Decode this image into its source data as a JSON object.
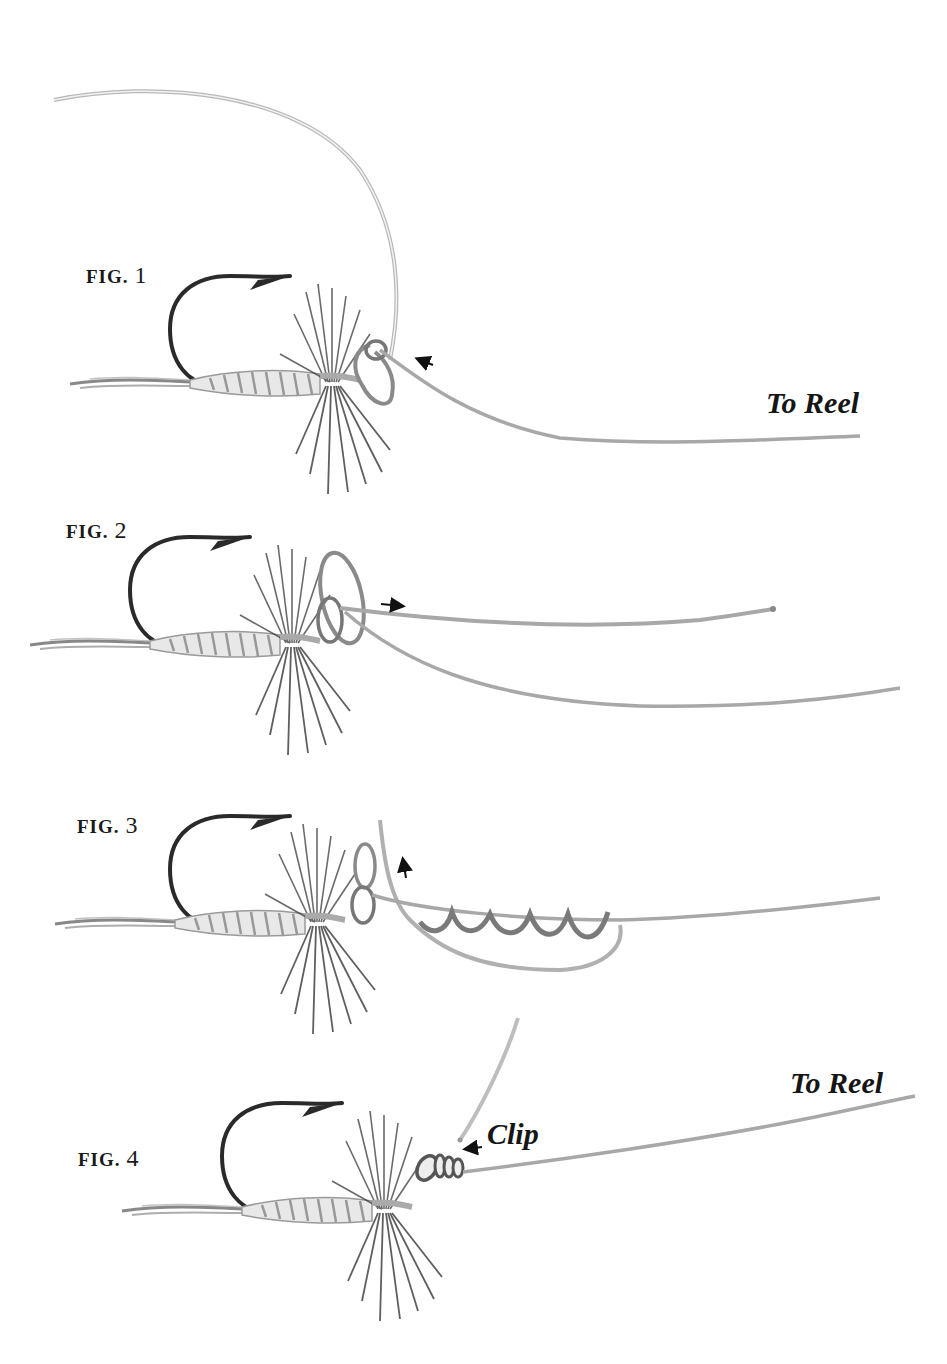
{
  "diagram": {
    "colors": {
      "background": "#ffffff",
      "ink": "#1a1a1a",
      "line_light": "#d8d8d8",
      "line_dark": "#6a6a6a",
      "hackle": "#3a3a3a"
    },
    "figures": [
      {
        "id": "fig1",
        "label_prefix": "FIG.",
        "label_number": "1",
        "annotation": "To Reel",
        "arrow": "left"
      },
      {
        "id": "fig2",
        "label_prefix": "FIG.",
        "label_number": "2",
        "annotation": "",
        "arrow": "right"
      },
      {
        "id": "fig3",
        "label_prefix": "FIG.",
        "label_number": "3",
        "annotation": "",
        "arrow": "up"
      },
      {
        "id": "fig4",
        "label_prefix": "FIG.",
        "label_number": "4",
        "annotation": "To Reel",
        "callout": "Clip",
        "arrow": "left"
      }
    ]
  }
}
